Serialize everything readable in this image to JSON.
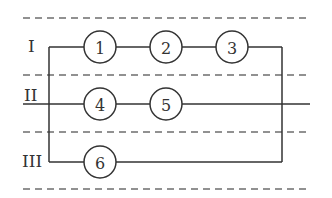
{
  "diagram": {
    "rows": [
      {
        "label": "I",
        "components": [
          "1",
          "2",
          "3"
        ]
      },
      {
        "label": "II",
        "components": [
          "4",
          "5"
        ]
      },
      {
        "label": "III",
        "components": [
          "6"
        ]
      }
    ],
    "colors": {
      "line": "#333333",
      "dash": "#6e6e6e",
      "background": "#ffffff"
    }
  }
}
